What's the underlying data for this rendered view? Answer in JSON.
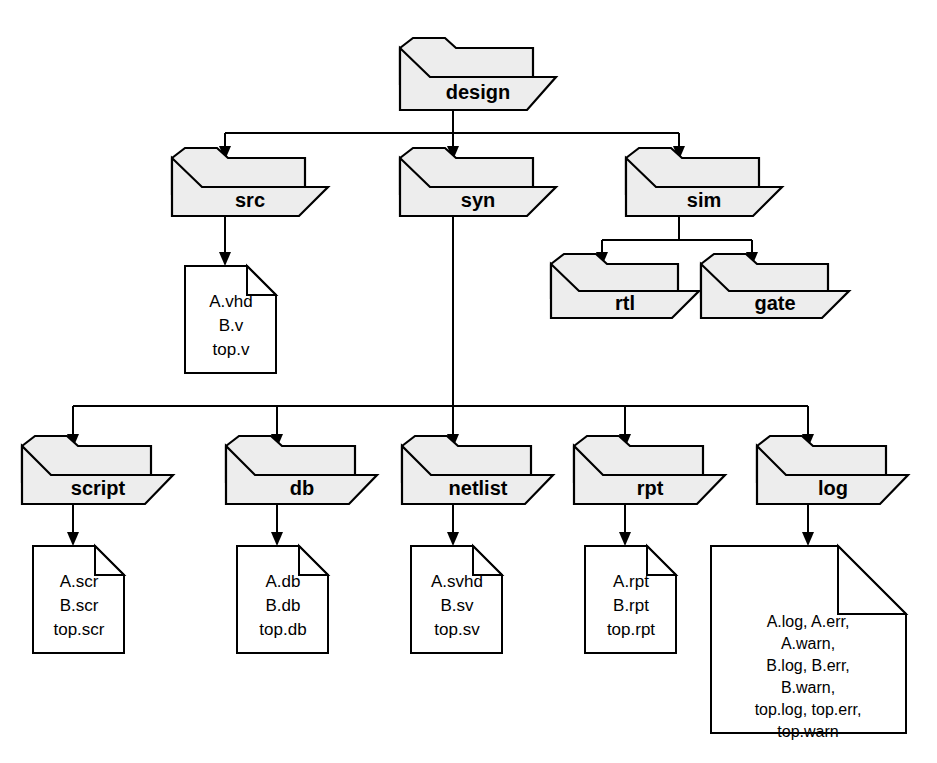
{
  "diagram": {
    "type": "directory-tree",
    "style": {
      "folder_fill": "#ededed",
      "file_fill": "#ffffff",
      "line_color": "#000000",
      "background": "#ffffff"
    },
    "nodes": {
      "design": {
        "label": "design",
        "kind": "folder"
      },
      "src": {
        "label": "src",
        "kind": "folder"
      },
      "syn": {
        "label": "syn",
        "kind": "folder"
      },
      "sim": {
        "label": "sim",
        "kind": "folder"
      },
      "rtl": {
        "label": "rtl",
        "kind": "folder"
      },
      "gate": {
        "label": "gate",
        "kind": "folder"
      },
      "script": {
        "label": "script",
        "kind": "folder"
      },
      "db": {
        "label": "db",
        "kind": "folder"
      },
      "netlist": {
        "label": "netlist",
        "kind": "folder"
      },
      "rpt": {
        "label": "rpt",
        "kind": "folder"
      },
      "log": {
        "label": "log",
        "kind": "folder"
      }
    },
    "files": {
      "src_files": {
        "kind": "file",
        "lines": [
          "A.vhd",
          "B.v",
          "top.v"
        ]
      },
      "script_files": {
        "kind": "file",
        "lines": [
          "A.scr",
          "B.scr",
          "top.scr"
        ]
      },
      "db_files": {
        "kind": "file",
        "lines": [
          "A.db",
          "B.db",
          "top.db"
        ]
      },
      "netlist_files": {
        "kind": "file",
        "lines": [
          "A.svhd",
          "B.sv",
          "top.sv"
        ]
      },
      "rpt_files": {
        "kind": "file",
        "lines": [
          "A.rpt",
          "B.rpt",
          "top.rpt"
        ]
      },
      "log_files": {
        "kind": "file",
        "lines": [
          "A.log, A.err,",
          "A.warn,",
          "B.log, B.err,",
          "B.warn,",
          "top.log, top.err,",
          "top.warn"
        ]
      }
    },
    "edges": [
      {
        "from": "design",
        "to": "src"
      },
      {
        "from": "design",
        "to": "syn"
      },
      {
        "from": "design",
        "to": "sim"
      },
      {
        "from": "src",
        "to": "src_files"
      },
      {
        "from": "sim",
        "to": "rtl"
      },
      {
        "from": "sim",
        "to": "gate"
      },
      {
        "from": "syn",
        "to": "script"
      },
      {
        "from": "syn",
        "to": "db"
      },
      {
        "from": "syn",
        "to": "netlist"
      },
      {
        "from": "syn",
        "to": "rpt"
      },
      {
        "from": "syn",
        "to": "log"
      },
      {
        "from": "script",
        "to": "script_files"
      },
      {
        "from": "db",
        "to": "db_files"
      },
      {
        "from": "netlist",
        "to": "netlist_files"
      },
      {
        "from": "rpt",
        "to": "rpt_files"
      },
      {
        "from": "log",
        "to": "log_files"
      }
    ]
  }
}
